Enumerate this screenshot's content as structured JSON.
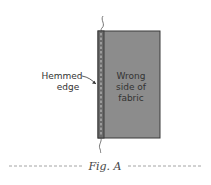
{
  "diagram": {
    "fabric_label_lines": [
      "Wrong",
      "side of",
      "fabric"
    ],
    "hem_label_lines": [
      "Hemmed",
      "edge"
    ],
    "caption": "Fig. A",
    "colors": {
      "fabric": "#8c8c8c",
      "hem": "#6a6a6a",
      "outline": "#3a3a3a",
      "dash": "#9a9a9a"
    }
  }
}
